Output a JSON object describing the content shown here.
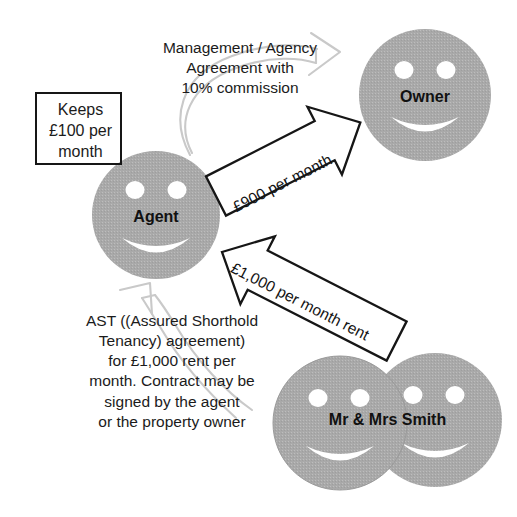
{
  "diagram": {
    "background_color": "#ffffff",
    "face_fill": "#aaaaaa",
    "face_feature_color": "#ffffff",
    "arrow_outline_color": "#161616",
    "ghost_arrow_color": "#c9c9c9",
    "text_color": "#1b1b1b"
  },
  "actors": {
    "agent": {
      "label": "Agent"
    },
    "owner": {
      "label": "Owner"
    },
    "tenants": {
      "label": "Mr & Mrs Smith"
    }
  },
  "notes": {
    "keeps": "Keeps\n£100 per\nmonth",
    "management_agreement": "Management / Agency\nAgreement with\n10% commission",
    "ast": "AST ((Assured Shorthold\nTenancy) agreement)\nfor £1,000 rent per\nmonth. Contract may be\nsigned by the agent\nor the property owner"
  },
  "flows": {
    "agent_to_owner": {
      "label": "£900 per month",
      "direction": "agent-to-owner"
    },
    "tenants_to_agent": {
      "label": "£1,000 per month rent",
      "direction": "tenants-to-agent"
    }
  }
}
